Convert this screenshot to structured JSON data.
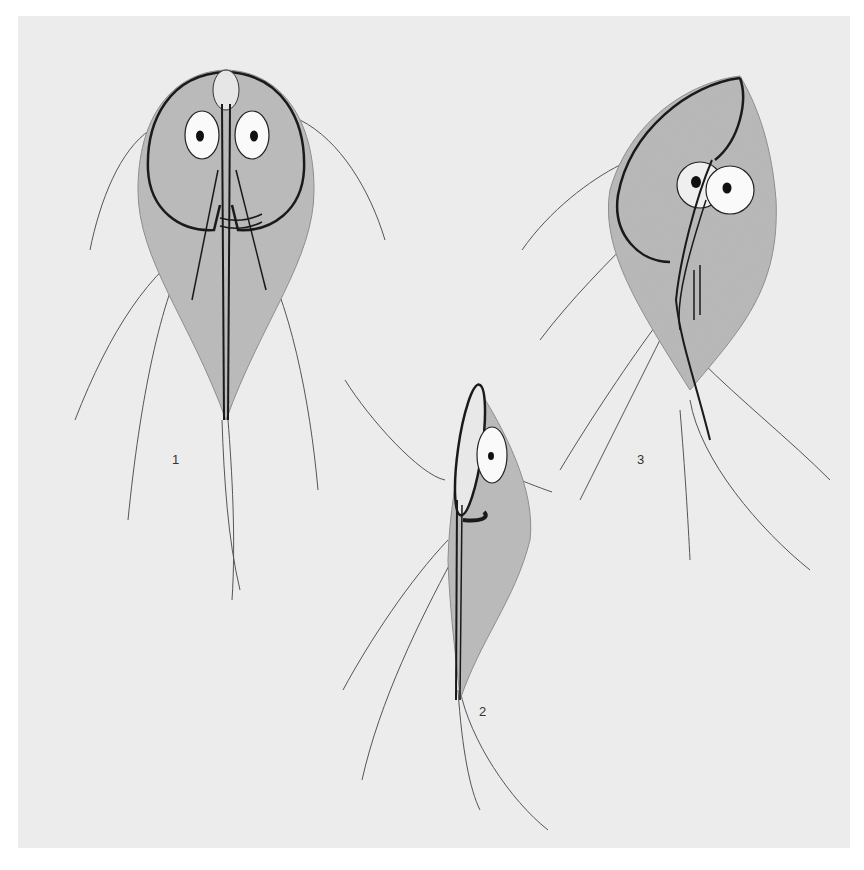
{
  "figure": {
    "background_color": "#ececec",
    "body_tone_color": "#b5b5b5",
    "line_color": "#1a1a1a",
    "panels": [
      {
        "label": "1",
        "view": "ventral view"
      },
      {
        "label": "2",
        "view": "lateral view"
      },
      {
        "label": "3",
        "view": "oblique view"
      }
    ]
  }
}
